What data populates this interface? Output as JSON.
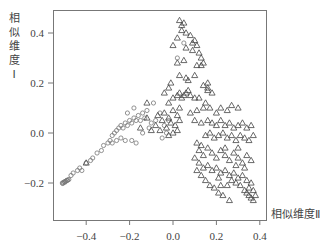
{
  "chart_data": {
    "type": "scatter",
    "title": "",
    "xlabel": "相似维度Ⅱ",
    "ylabel": "相似维度Ⅰ",
    "ylabel_chars": [
      "相",
      "似",
      "维",
      "度",
      "Ⅰ"
    ],
    "xlim": [
      -0.56,
      0.42
    ],
    "ylim": [
      -0.35,
      0.49
    ],
    "x_ticks": [
      -0.4,
      -0.2,
      0.0,
      0.2,
      0.4
    ],
    "x_tick_labels": [
      "-0.4",
      "-0.2",
      "0.0",
      "0.2",
      "0.4"
    ],
    "y_ticks": [
      -0.2,
      0.0,
      0.2,
      0.4
    ],
    "y_tick_labels": [
      "-0.2",
      "0.0",
      "0.2",
      "0.4"
    ],
    "grid": false,
    "legend": "none",
    "series": [
      {
        "name": "circles",
        "marker": "circle",
        "points": [
          [
            -0.51,
            -0.2
          ],
          [
            -0.505,
            -0.198
          ],
          [
            -0.5,
            -0.195
          ],
          [
            -0.495,
            -0.193
          ],
          [
            -0.49,
            -0.19
          ],
          [
            -0.485,
            -0.188
          ],
          [
            -0.48,
            -0.186
          ],
          [
            -0.508,
            -0.202
          ],
          [
            -0.498,
            -0.197
          ],
          [
            -0.488,
            -0.19
          ],
          [
            -0.47,
            -0.17
          ],
          [
            -0.46,
            -0.16
          ],
          [
            -0.44,
            -0.15
          ],
          [
            -0.43,
            -0.14
          ],
          [
            -0.42,
            -0.15
          ],
          [
            -0.4,
            -0.12
          ],
          [
            -0.38,
            -0.11
          ],
          [
            -0.37,
            -0.1
          ],
          [
            -0.35,
            -0.08
          ],
          [
            -0.33,
            -0.07
          ],
          [
            -0.32,
            -0.05
          ],
          [
            -0.3,
            -0.04
          ],
          [
            -0.29,
            -0.03
          ],
          [
            -0.28,
            -0.01
          ],
          [
            -0.27,
            0.0
          ],
          [
            -0.26,
            0.01
          ],
          [
            -0.25,
            0.02
          ],
          [
            -0.24,
            0.03
          ],
          [
            -0.23,
            0.02
          ],
          [
            -0.22,
            0.04
          ],
          [
            -0.21,
            0.03
          ],
          [
            -0.2,
            0.05
          ],
          [
            -0.19,
            0.04
          ],
          [
            -0.18,
            0.06
          ],
          [
            -0.17,
            0.05
          ],
          [
            -0.16,
            0.07
          ],
          [
            -0.15,
            0.05
          ],
          [
            -0.14,
            0.08
          ],
          [
            -0.13,
            0.06
          ],
          [
            -0.12,
            0.09
          ],
          [
            -0.28,
            -0.04
          ],
          [
            -0.26,
            -0.03
          ],
          [
            -0.24,
            -0.02
          ],
          [
            -0.22,
            -0.03
          ],
          [
            -0.19,
            -0.03
          ],
          [
            -0.17,
            -0.04
          ],
          [
            -0.14,
            0.0
          ],
          [
            -0.11,
            0.02
          ],
          [
            -0.1,
            0.04
          ],
          [
            -0.08,
            0.05
          ],
          [
            -0.21,
            0.08
          ],
          [
            -0.18,
            0.1
          ],
          [
            -0.09,
            0.12
          ],
          [
            -0.06,
            0.08
          ],
          [
            -0.04,
            0.03
          ],
          [
            0.02,
            0.3
          ],
          [
            0.05,
            0.36
          ],
          [
            -0.02,
            0.05
          ],
          [
            -0.05,
            -0.02
          ],
          [
            -0.03,
            0.0
          ]
        ]
      },
      {
        "name": "triangles",
        "marker": "triangle",
        "points": [
          [
            -0.4,
            -0.12
          ],
          [
            -0.15,
            0.02
          ],
          [
            -0.12,
            0.06
          ],
          [
            -0.1,
            0.01
          ],
          [
            -0.08,
            0.03
          ],
          [
            -0.07,
            0.07
          ],
          [
            -0.05,
            0.05
          ],
          [
            -0.04,
            0.08
          ],
          [
            -0.03,
            0.02
          ],
          [
            -0.02,
            0.06
          ],
          [
            -0.01,
            0.04
          ],
          [
            0.0,
            0.09
          ],
          [
            0.01,
            0.03
          ],
          [
            0.02,
            0.07
          ],
          [
            0.03,
            0.05
          ],
          [
            -0.06,
            0.01
          ],
          [
            -0.02,
            -0.01
          ],
          [
            0.0,
            0.0
          ],
          [
            0.02,
            0.01
          ],
          [
            -0.12,
            0.12
          ],
          [
            0.0,
            0.14
          ],
          [
            0.02,
            0.15
          ],
          [
            0.03,
            0.16
          ],
          [
            0.04,
            0.14
          ],
          [
            0.05,
            0.15
          ],
          [
            0.06,
            0.16
          ],
          [
            0.07,
            0.17
          ],
          [
            0.08,
            0.15
          ],
          [
            0.1,
            0.14
          ],
          [
            0.12,
            0.14
          ],
          [
            -0.02,
            0.12
          ],
          [
            0.15,
            0.12
          ],
          [
            0.16,
            0.17
          ],
          [
            0.18,
            0.16
          ],
          [
            0.03,
            0.45
          ],
          [
            0.04,
            0.43
          ],
          [
            0.05,
            0.44
          ],
          [
            0.04,
            0.41
          ],
          [
            0.06,
            0.4
          ],
          [
            0.02,
            0.38
          ],
          [
            0.08,
            0.39
          ],
          [
            0.09,
            0.36
          ],
          [
            0.1,
            0.37
          ],
          [
            0.11,
            0.35
          ],
          [
            0.0,
            0.35
          ],
          [
            0.06,
            0.34
          ],
          [
            0.09,
            0.33
          ],
          [
            0.12,
            0.32
          ],
          [
            0.13,
            0.3
          ],
          [
            0.02,
            0.28
          ],
          [
            0.05,
            0.29
          ],
          [
            0.11,
            0.27
          ],
          [
            0.13,
            0.27
          ],
          [
            0.14,
            0.28
          ],
          [
            0.06,
            0.22
          ],
          [
            0.07,
            0.21
          ],
          [
            0.1,
            0.23
          ],
          [
            0.14,
            0.19
          ],
          [
            0.16,
            0.18
          ],
          [
            0.16,
            0.2
          ],
          [
            0.03,
            0.23
          ],
          [
            -0.02,
            0.18
          ],
          [
            -0.01,
            0.2
          ],
          [
            -0.04,
            0.16
          ],
          [
            0.03,
            0.1
          ],
          [
            0.08,
            0.08
          ],
          [
            0.11,
            0.09
          ],
          [
            0.14,
            0.1
          ],
          [
            0.17,
            0.1
          ],
          [
            0.2,
            0.08
          ],
          [
            0.22,
            0.1
          ],
          [
            0.25,
            0.09
          ],
          [
            0.27,
            0.11
          ],
          [
            0.3,
            0.1
          ],
          [
            0.1,
            0.05
          ],
          [
            0.13,
            0.04
          ],
          [
            0.16,
            0.05
          ],
          [
            0.18,
            0.04
          ],
          [
            0.2,
            0.03
          ],
          [
            0.22,
            0.05
          ],
          [
            0.24,
            0.03
          ],
          [
            0.26,
            0.04
          ],
          [
            0.28,
            0.02
          ],
          [
            0.3,
            0.03
          ],
          [
            0.32,
            0.04
          ],
          [
            0.34,
            0.02
          ],
          [
            0.36,
            0.03
          ],
          [
            0.15,
            -0.01
          ],
          [
            0.17,
            0.0
          ],
          [
            0.19,
            -0.02
          ],
          [
            0.21,
            -0.01
          ],
          [
            0.23,
            0.0
          ],
          [
            0.25,
            -0.02
          ],
          [
            0.27,
            -0.01
          ],
          [
            0.29,
            -0.03
          ],
          [
            0.31,
            -0.01
          ],
          [
            0.33,
            -0.02
          ],
          [
            0.35,
            -0.03
          ],
          [
            0.37,
            -0.01
          ],
          [
            0.11,
            -0.04
          ],
          [
            0.12,
            -0.07
          ],
          [
            0.13,
            -0.05
          ],
          [
            0.14,
            -0.09
          ],
          [
            0.16,
            -0.06
          ],
          [
            0.18,
            -0.08
          ],
          [
            0.2,
            -0.1
          ],
          [
            0.22,
            -0.07
          ],
          [
            0.24,
            -0.09
          ],
          [
            0.26,
            -0.11
          ],
          [
            0.28,
            -0.08
          ],
          [
            0.3,
            -0.1
          ],
          [
            0.32,
            -0.12
          ],
          [
            0.34,
            -0.09
          ],
          [
            0.36,
            -0.11
          ],
          [
            0.12,
            -0.12
          ],
          [
            0.14,
            -0.14
          ],
          [
            0.16,
            -0.13
          ],
          [
            0.18,
            -0.15
          ],
          [
            0.2,
            -0.14
          ],
          [
            0.22,
            -0.16
          ],
          [
            0.24,
            -0.15
          ],
          [
            0.26,
            -0.17
          ],
          [
            0.28,
            -0.16
          ],
          [
            0.3,
            -0.18
          ],
          [
            0.32,
            -0.17
          ],
          [
            0.34,
            -0.19
          ],
          [
            0.36,
            -0.2
          ],
          [
            0.35,
            -0.22
          ],
          [
            0.37,
            -0.23
          ],
          [
            0.33,
            -0.23
          ],
          [
            0.31,
            -0.21
          ],
          [
            0.29,
            -0.2
          ],
          [
            0.27,
            -0.19
          ],
          [
            0.25,
            -0.21
          ],
          [
            0.13,
            -0.17
          ],
          [
            0.15,
            -0.19
          ],
          [
            0.17,
            -0.21
          ],
          [
            0.19,
            -0.22
          ],
          [
            0.21,
            -0.24
          ],
          [
            0.23,
            -0.25
          ],
          [
            0.26,
            -0.27
          ],
          [
            0.22,
            -0.21
          ],
          [
            0.38,
            -0.25
          ],
          [
            0.36,
            -0.26
          ],
          [
            0.34,
            -0.24
          ],
          [
            0.37,
            -0.27
          ],
          [
            0.35,
            -0.25
          ],
          [
            0.24,
            -0.06
          ],
          [
            0.3,
            -0.06
          ],
          [
            0.1,
            -0.1
          ],
          [
            0.11,
            -0.15
          ],
          [
            0.21,
            -0.18
          ],
          [
            0.33,
            -0.14
          ],
          [
            0.29,
            -0.13
          ]
        ]
      }
    ]
  }
}
